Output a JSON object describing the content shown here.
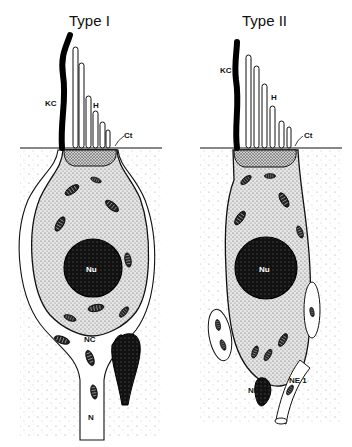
{
  "figure": {
    "panels": [
      {
        "title": "Type I",
        "labels": {
          "kinocilium": "KC",
          "hairs": "H",
          "cuticle": "Ct",
          "nucleus": "Nu",
          "nerve_calyx": "NC",
          "nerve": "N"
        }
      },
      {
        "title": "Type II",
        "labels": {
          "kinocilium": "KC",
          "hairs": "H",
          "cuticle": "Ct",
          "nucleus": "Nu",
          "nerve_ending_1": "NE 1",
          "nerve_ending_2": "NE 2"
        }
      }
    ],
    "colors": {
      "ink": "#111111",
      "background": "#ffffff",
      "stipple": "#9a9a9a"
    }
  }
}
